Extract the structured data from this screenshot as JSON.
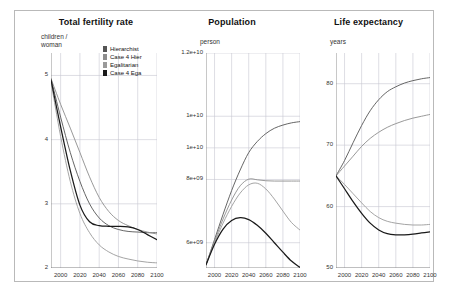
{
  "figure": {
    "background": "#ffffff",
    "border_color": "#b9b9b9",
    "grid_color": "#c8c8d2",
    "axis_color": "#777777"
  },
  "legend": {
    "items": [
      {
        "label": "Hierarchist",
        "color": "#555555"
      },
      {
        "label": "Case 4 Hier",
        "color": "#8d8d8d"
      },
      {
        "label": "Egalitarian",
        "color": "#9a9a9a"
      },
      {
        "label": "Case 4 Ega",
        "color": "#1a1a1a"
      }
    ]
  },
  "chart_data": [
    {
      "type": "line",
      "title": "Total fertility rate",
      "ylabel": "children /\nwoman",
      "xlabel": "",
      "xlim": [
        1990,
        2100
      ],
      "ylim": [
        2,
        5.35
      ],
      "xticks": [
        2000,
        2020,
        2040,
        2060,
        2080,
        2100
      ],
      "yticks": [
        2,
        3,
        4,
        5
      ],
      "grid": true,
      "legend_position": "top-right-inside",
      "x": [
        1990,
        2000,
        2010,
        2020,
        2030,
        2040,
        2050,
        2060,
        2070,
        2080,
        2090,
        2100
      ],
      "series": [
        {
          "name": "Hierarchist",
          "color": "#555555",
          "values": [
            4.95,
            4.35,
            3.8,
            3.35,
            3.0,
            2.78,
            2.66,
            2.6,
            2.57,
            2.56,
            2.55,
            2.55
          ]
        },
        {
          "name": "Case 4 Hier",
          "color": "#8d8d8d",
          "values": [
            4.95,
            4.55,
            4.18,
            3.8,
            3.42,
            3.1,
            2.88,
            2.74,
            2.66,
            2.6,
            2.56,
            2.53
          ]
        },
        {
          "name": "Egalitarian",
          "color": "#9a9a9a",
          "values": [
            4.9,
            4.05,
            3.35,
            2.85,
            2.55,
            2.36,
            2.25,
            2.18,
            2.14,
            2.11,
            2.09,
            2.08
          ]
        },
        {
          "name": "Case 4 Ega",
          "color": "#1a1a1a",
          "values": [
            4.93,
            4.2,
            3.52,
            2.98,
            2.72,
            2.66,
            2.65,
            2.65,
            2.64,
            2.6,
            2.52,
            2.44
          ]
        }
      ]
    },
    {
      "type": "line",
      "title": "Population",
      "ylabel": "person",
      "xlabel": "",
      "xlim": [
        1990,
        2100
      ],
      "ylim": [
        5200000000,
        12000000000
      ],
      "xticks": [
        2000,
        2020,
        2040,
        2060,
        2080,
        2100
      ],
      "yticks": [
        6000000000,
        8000000000,
        9000000000,
        10000000000,
        12000000000
      ],
      "ytick_labels": [
        "6e+09",
        "8e+09",
        "1e+10",
        "1e+10",
        "1.2e+10"
      ],
      "grid": true,
      "x": [
        1990,
        2000,
        2010,
        2020,
        2030,
        2040,
        2050,
        2060,
        2070,
        2080,
        2090,
        2100
      ],
      "series": [
        {
          "name": "Hierarchist",
          "color": "#555555",
          "values": [
            5300000000,
            6100000000,
            6900000000,
            7650000000,
            8300000000,
            8850000000,
            9200000000,
            9450000000,
            9620000000,
            9720000000,
            9790000000,
            9830000000
          ]
        },
        {
          "name": "Case 4 Hier",
          "color": "#8d8d8d",
          "values": [
            5300000000,
            6050000000,
            6750000000,
            7350000000,
            7800000000,
            8010000000,
            7990000000,
            7960000000,
            7950000000,
            7950000000,
            7950000000,
            7950000000
          ]
        },
        {
          "name": "Egalitarian",
          "color": "#9a9a9a",
          "values": [
            5300000000,
            6000000000,
            6620000000,
            7150000000,
            7570000000,
            7830000000,
            7880000000,
            7700000000,
            7380000000,
            7000000000,
            6640000000,
            6400000000
          ]
        },
        {
          "name": "Case 4 Ega",
          "color": "#1a1a1a",
          "values": [
            5300000000,
            5950000000,
            6430000000,
            6700000000,
            6790000000,
            6730000000,
            6550000000,
            6300000000,
            6000000000,
            5700000000,
            5420000000,
            5220000000
          ]
        }
      ]
    },
    {
      "type": "line",
      "title": "Life expectancy",
      "ylabel": "years",
      "xlabel": "",
      "xlim": [
        1990,
        2100
      ],
      "ylim": [
        50,
        85
      ],
      "xticks": [
        2000,
        2020,
        2040,
        2060,
        2080,
        2100
      ],
      "yticks": [
        50,
        60,
        70,
        80
      ],
      "grid": true,
      "x": [
        1990,
        2000,
        2010,
        2020,
        2030,
        2040,
        2050,
        2060,
        2070,
        2080,
        2090,
        2100
      ],
      "series": [
        {
          "name": "Hierarchist",
          "color": "#555555",
          "values": [
            65.0,
            67.5,
            70.4,
            73.2,
            75.6,
            77.4,
            78.7,
            79.5,
            80.1,
            80.5,
            80.8,
            81.0
          ]
        },
        {
          "name": "Case 4 Hier",
          "color": "#8d8d8d",
          "values": [
            65.0,
            66.6,
            68.2,
            69.8,
            71.1,
            72.1,
            72.9,
            73.5,
            74.0,
            74.4,
            74.7,
            75.0
          ]
        },
        {
          "name": "Egalitarian",
          "color": "#9a9a9a",
          "values": [
            65.0,
            63.6,
            62.1,
            60.6,
            59.2,
            58.2,
            57.6,
            57.3,
            57.1,
            57.0,
            57.0,
            57.1
          ]
        },
        {
          "name": "Case 4 Ega",
          "color": "#1a1a1a",
          "values": [
            65.0,
            62.9,
            60.8,
            58.9,
            57.3,
            56.2,
            55.6,
            55.4,
            55.4,
            55.5,
            55.7,
            55.9
          ]
        }
      ]
    }
  ]
}
